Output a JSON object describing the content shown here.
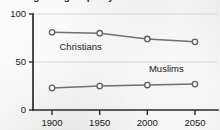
{
  "figure": {
    "clipped_title": "Religious groups by share",
    "background_color": "#ececeb",
    "line_color": "#6e7073",
    "marker_fill_color": "#fbfbfa",
    "marker_stroke_color": "#5c5e61",
    "axis_color": "#2b2d2f",
    "grid_color": "#d2d2d0"
  },
  "chart_data": {
    "type": "line",
    "title": "",
    "xlabel": "",
    "ylabel": "",
    "x": [
      1900,
      1950,
      2000,
      2050
    ],
    "categories": [
      "1900",
      "1950",
      "2000",
      "2050"
    ],
    "series": [
      {
        "name": "Christians",
        "values": [
          81,
          80,
          74,
          71
        ]
      },
      {
        "name": "Muslims",
        "values": [
          23,
          25,
          26,
          27
        ]
      }
    ],
    "xlim": [
      1880,
      2070
    ],
    "ylim": [
      0,
      100
    ],
    "y_ticks": [
      0,
      50,
      100
    ],
    "y_tick_labels": [
      "0",
      "50",
      "100"
    ],
    "x_ticks": [
      1900,
      1950,
      2000,
      2050
    ],
    "x_tick_labels": [
      "1900",
      "1950",
      "2000",
      "2050"
    ],
    "grid": true,
    "grid_axis": "y",
    "legend": "inline-labels",
    "annotations": [
      {
        "text": "Christians",
        "x": 1930,
        "y": 62
      },
      {
        "text": "Muslims",
        "x": 2020,
        "y": 40
      }
    ]
  }
}
